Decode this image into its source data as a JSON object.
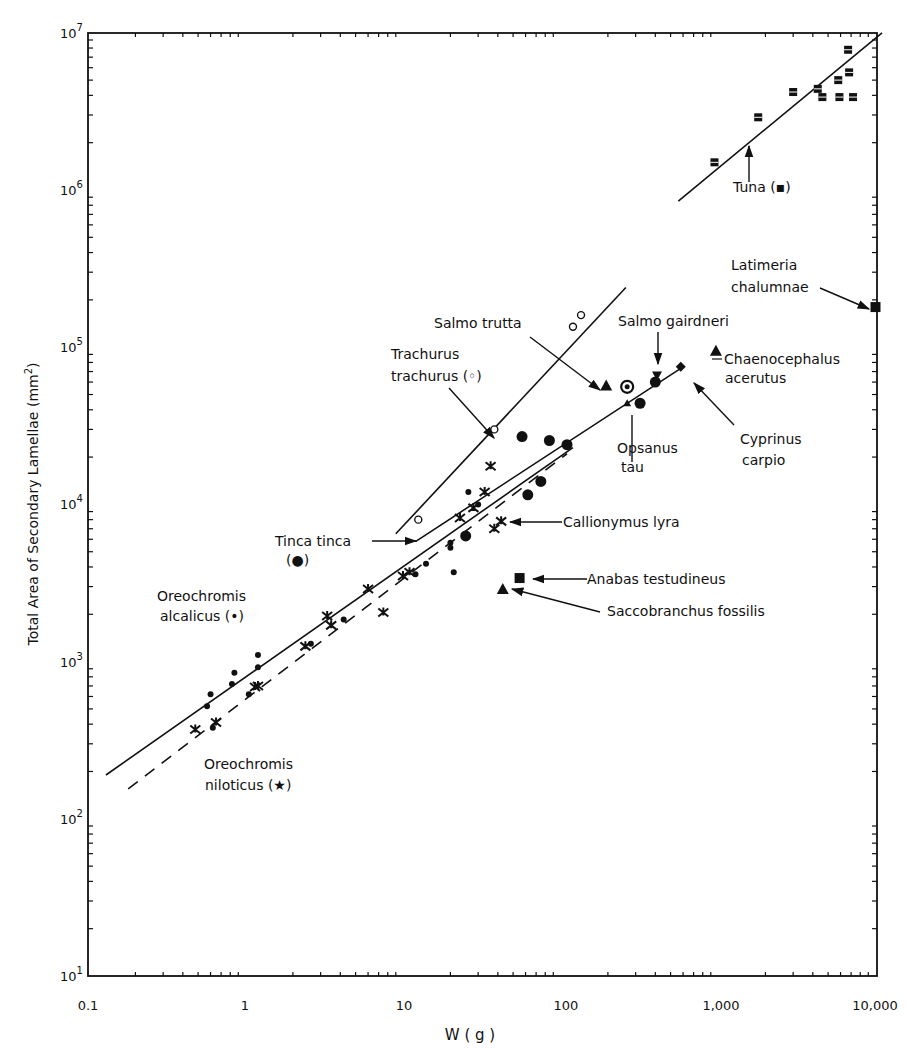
{
  "chart_data": {
    "type": "scatter",
    "title": "",
    "xlabel": "W ( g )",
    "ylabel": "Total Area of Secondary Lamellae (mm2)",
    "xscale": "log",
    "yscale": "log",
    "xlim": [
      0.1,
      12000
    ],
    "ylim": [
      10,
      10000000
    ],
    "grid": false,
    "x_ticks": [
      {
        "value": 0.1,
        "label": "0.1"
      },
      {
        "value": 1,
        "label": "1"
      },
      {
        "value": 10,
        "label": "10"
      },
      {
        "value": 100,
        "label": "100"
      },
      {
        "value": 1000,
        "label": "1,000"
      },
      {
        "value": 10000,
        "label": "10,000"
      }
    ],
    "y_ticks": [
      {
        "value": 10,
        "base": "10",
        "exp": "1"
      },
      {
        "value": 100,
        "base": "10",
        "exp": "2"
      },
      {
        "value": 1000,
        "base": "10",
        "exp": "3"
      },
      {
        "value": 10000,
        "base": "10",
        "exp": "4"
      },
      {
        "value": 100000,
        "base": "10",
        "exp": "5"
      },
      {
        "value": 1000000,
        "base": "10",
        "exp": "6"
      },
      {
        "value": 10000000,
        "base": "10",
        "exp": "7"
      }
    ],
    "regression_lines": [
      {
        "name": "Oreochromis alcalicus",
        "style": "solid",
        "points": [
          [
            0.13,
            190
          ],
          [
            120,
            23000
          ]
        ]
      },
      {
        "name": "Oreochromis niloticus",
        "style": "dashed",
        "points": [
          [
            0.18,
            155
          ],
          [
            110,
            21000
          ]
        ]
      },
      {
        "name": "Trachurus trachurus",
        "style": "solid",
        "points": [
          [
            9,
            6500
          ],
          [
            260,
            240000
          ]
        ]
      },
      {
        "name": "Tinca tinca",
        "style": "solid",
        "points": [
          [
            12,
            5800
          ],
          [
            600,
            75000
          ]
        ]
      },
      {
        "name": "Tuna",
        "style": "solid",
        "points": [
          [
            560,
            850000
          ],
          [
            11000,
            10000000
          ]
        ]
      }
    ],
    "series": [
      {
        "name": "Oreochromis alcalicus",
        "marker": "small-dot",
        "points": [
          [
            0.6,
            620
          ],
          [
            0.57,
            520
          ],
          [
            0.62,
            380
          ],
          [
            0.85,
            850
          ],
          [
            0.82,
            720
          ],
          [
            1.05,
            620
          ],
          [
            1.2,
            1100
          ],
          [
            1.2,
            920
          ],
          [
            2.6,
            1300
          ],
          [
            4.2,
            1850
          ],
          [
            12,
            3600
          ],
          [
            14,
            4200
          ],
          [
            20,
            5700
          ],
          [
            20,
            5300
          ],
          [
            21,
            3700
          ],
          [
            26,
            12000
          ],
          [
            30,
            10000
          ]
        ]
      },
      {
        "name": "Oreochromis niloticus",
        "marker": "star",
        "points": [
          [
            0.48,
            370
          ],
          [
            0.65,
            410
          ],
          [
            1.2,
            700
          ],
          [
            1.15,
            690
          ],
          [
            2.4,
            1250
          ],
          [
            3.3,
            1950
          ],
          [
            3.5,
            1700
          ],
          [
            6,
            2900
          ],
          [
            7.5,
            2050
          ],
          [
            10,
            3500
          ],
          [
            11,
            3700
          ],
          [
            23,
            8200
          ],
          [
            28,
            9500
          ],
          [
            36,
            17500
          ],
          [
            33,
            12000
          ]
        ]
      },
      {
        "name": "Callionymus lyra",
        "marker": "cross",
        "points": [
          [
            38,
            7000
          ],
          [
            42,
            7800
          ]
        ]
      },
      {
        "name": "Trachurus trachurus",
        "marker": "open-circle",
        "points": [
          [
            12.5,
            8000
          ],
          [
            38,
            30000
          ],
          [
            120,
            135000
          ],
          [
            135,
            160000
          ]
        ]
      },
      {
        "name": "Tinca tinca",
        "marker": "large-dot",
        "points": [
          [
            25,
            6300
          ],
          [
            57,
            27000
          ],
          [
            62,
            11500
          ],
          [
            75,
            14000
          ],
          [
            85,
            25500
          ],
          [
            110,
            24000
          ],
          [
            320,
            44000
          ]
        ]
      },
      {
        "name": "Salmo trutta",
        "marker": "triangle",
        "points": [
          [
            195,
            57000
          ]
        ]
      },
      {
        "name": "Salmo gairdneri",
        "marker": "inverted-triangle",
        "points": [
          [
            410,
            66000
          ]
        ]
      },
      {
        "name": "Salmo gairdneri (fit)",
        "marker": "large-dot",
        "points": [
          [
            400,
            60000
          ]
        ]
      },
      {
        "name": "Opsanus tau",
        "marker": "ringed-dot",
        "points": [
          [
            265,
            56000
          ]
        ]
      },
      {
        "name": "Opsanus tau (line)",
        "marker": "small-triangle",
        "points": [
          [
            265,
            44000
          ]
        ]
      },
      {
        "name": "Cyprinus carpio",
        "marker": "diamond",
        "points": [
          [
            580,
            75000
          ]
        ]
      },
      {
        "name": "Chaenocephalus acerutus",
        "marker": "triangle",
        "points": [
          [
            970,
            95000
          ]
        ]
      },
      {
        "name": "Latimeria chalumnae",
        "marker": "square",
        "points": [
          [
            10000,
            180000
          ]
        ]
      },
      {
        "name": "Anabas testudineus",
        "marker": "square",
        "points": [
          [
            55,
            3400
          ]
        ]
      },
      {
        "name": "Saccobranchus fossilis",
        "marker": "triangle",
        "points": [
          [
            43,
            2900
          ]
        ]
      },
      {
        "name": "Tuna",
        "marker": "hash-square",
        "points": [
          [
            950,
            1500000
          ],
          [
            1800,
            2900000
          ],
          [
            3000,
            4200000
          ],
          [
            4300,
            4400000
          ],
          [
            4600,
            3900000
          ],
          [
            5800,
            5000000
          ],
          [
            5900,
            3900000
          ],
          [
            6800,
            5600000
          ],
          [
            7200,
            3900000
          ],
          [
            6700,
            7800000
          ]
        ]
      }
    ],
    "annotations": [
      {
        "id": "tuna",
        "text": "Tuna (▪)"
      },
      {
        "id": "latimeria1",
        "text": "Latimeria"
      },
      {
        "id": "latimeria2",
        "text": "chalumnae"
      },
      {
        "id": "salmo_trutta",
        "text": "Salmo trutta"
      },
      {
        "id": "salmo_gairdneri",
        "text": "Salmo gairdneri"
      },
      {
        "id": "chaeno1",
        "text": "Chaenocephalus"
      },
      {
        "id": "chaeno2",
        "text": "acerutus"
      },
      {
        "id": "trachurus1",
        "text": "Trachurus"
      },
      {
        "id": "trachurus2",
        "text": "trachurus (◦)"
      },
      {
        "id": "opsanus1",
        "text": "Opsanus"
      },
      {
        "id": "opsanus2",
        "text": "tau"
      },
      {
        "id": "cyprinus1",
        "text": "Cyprinus"
      },
      {
        "id": "cyprinus2",
        "text": "carpio"
      },
      {
        "id": "tinca1",
        "text": "Tinca  tinca"
      },
      {
        "id": "tinca2",
        "text": "(●)"
      },
      {
        "id": "callionymus",
        "text": "Callionymus lyra"
      },
      {
        "id": "anabas",
        "text": "Anabas  testudineus"
      },
      {
        "id": "saccobranchus",
        "text": "Saccobranchus  fossilis"
      },
      {
        "id": "alcalicus1",
        "text": "Oreochromis"
      },
      {
        "id": "alcalicus2",
        "text": "alcalicus (•)"
      },
      {
        "id": "niloticus1",
        "text": "Oreochromis"
      },
      {
        "id": "niloticus2",
        "text": "niloticus (★)"
      }
    ]
  },
  "labels": {
    "xlabel": "W ( g )",
    "ylabel_main": "Total  Area  of  Secondary  Lamellae  (mm",
    "ylabel_sup": "2",
    "ylabel_end": ")",
    "x0": "0.1",
    "x1": "1",
    "x2": "10",
    "x3": "100",
    "x4": "1,000",
    "x5": "10,000",
    "y1_exp": "1",
    "y2_exp": "2",
    "y3_exp": "3",
    "y4_exp": "4",
    "y5_exp": "5",
    "y6_exp": "6",
    "y7_exp": "7",
    "y_base": "10",
    "tuna": "Tuna (▪)",
    "latimeria1": "Latimeria",
    "latimeria2": "chalumnae",
    "salmo_trutta": "Salmo trutta",
    "salmo_gairdneri": "Salmo gairdneri",
    "chaeno1": "Chaenocephalus",
    "chaeno2": "acerutus",
    "trachurus1": "Trachurus",
    "trachurus2": "trachurus (◦)",
    "opsanus1": "Opsanus",
    "opsanus2": "tau",
    "cyprinus1": "Cyprinus",
    "cyprinus2": "carpio",
    "tinca1": "Tinca  tinca",
    "tinca2": "(●)",
    "callionymus": "Callionymus lyra",
    "anabas": "Anabas  testudineus",
    "saccobranchus": "Saccobranchus  fossilis",
    "alcalicus1": "Oreochromis",
    "alcalicus2": "alcalicus (•)",
    "niloticus1": "Oreochromis",
    "niloticus2": "niloticus (★)"
  }
}
